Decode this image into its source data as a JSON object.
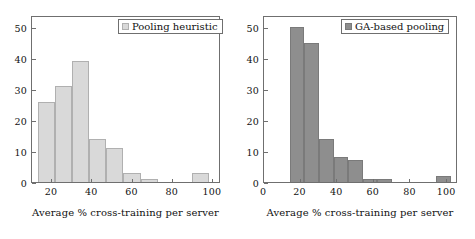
{
  "figure": {
    "width": 475,
    "height": 239,
    "background": "#ffffff"
  },
  "chart_data": [
    {
      "type": "bar",
      "subtype": "histogram",
      "title": "",
      "legend": "Pooling heuristic",
      "legend_position": "top-right",
      "bar_color": "#d9d9d9",
      "bar_edge_color": "#b0b0b0",
      "xlabel": "Average % cross-training per server",
      "ylabel": "",
      "xlim": [
        10,
        104
      ],
      "ylim": [
        0,
        54
      ],
      "xticks": [
        20,
        40,
        60,
        80,
        100
      ],
      "xticklabels": [
        "20",
        "40",
        "60",
        "80",
        "100"
      ],
      "yticks": [
        0,
        10,
        20,
        30,
        40,
        50
      ],
      "yticklabels": [
        "0",
        "10",
        "20",
        "30",
        "40",
        "50"
      ],
      "grid": false,
      "bin_edges": [
        13.0,
        21.5,
        30.0,
        38.5,
        47.0,
        55.5,
        64.0,
        72.5,
        81.0,
        89.5,
        98.0
      ],
      "values": [
        26,
        31,
        39,
        14,
        11,
        3,
        1,
        0,
        0,
        3
      ],
      "bins": [
        {
          "x0": 13.0,
          "x1": 21.5,
          "value": 26
        },
        {
          "x0": 21.5,
          "x1": 30.0,
          "value": 31
        },
        {
          "x0": 30.0,
          "x1": 38.5,
          "value": 39
        },
        {
          "x0": 38.5,
          "x1": 47.0,
          "value": 14
        },
        {
          "x0": 47.0,
          "x1": 55.5,
          "value": 11
        },
        {
          "x0": 55.5,
          "x1": 64.0,
          "value": 3
        },
        {
          "x0": 64.0,
          "x1": 72.5,
          "value": 1
        },
        {
          "x0": 72.5,
          "x1": 81.0,
          "value": 0
        },
        {
          "x0": 81.0,
          "x1": 89.5,
          "value": 0
        },
        {
          "x0": 89.5,
          "x1": 98.0,
          "value": 3
        }
      ]
    },
    {
      "type": "bar",
      "subtype": "histogram",
      "title": "",
      "legend": "GA-based pooling",
      "legend_position": "top-right",
      "bar_color": "#8e8e8e",
      "bar_edge_color": "#7a7a7a",
      "xlabel": "Average % cross-training per server",
      "ylabel": "",
      "xlim": [
        0,
        106
      ],
      "ylim": [
        0,
        54
      ],
      "xticks": [
        0,
        20,
        40,
        60,
        80,
        100
      ],
      "xticklabels": [
        "0",
        "20",
        "40",
        "60",
        "80",
        "100"
      ],
      "yticks": [
        0,
        10,
        20,
        30,
        40,
        50
      ],
      "yticklabels": [
        "0",
        "10",
        "20",
        "30",
        "40",
        "50"
      ],
      "grid": false,
      "bin_edges": [
        14.0,
        22.0,
        30.0,
        38.0,
        46.0,
        54.0,
        62.0,
        70.0,
        78.0,
        86.0,
        94.0,
        102.0
      ],
      "values": [
        50,
        45,
        14,
        8,
        7,
        1,
        1,
        0,
        0,
        2,
        0
      ],
      "bins": [
        {
          "x0": 14.0,
          "x1": 22.0,
          "value": 50
        },
        {
          "x0": 22.0,
          "x1": 30.0,
          "value": 45
        },
        {
          "x0": 30.0,
          "x1": 38.0,
          "value": 14
        },
        {
          "x0": 38.0,
          "x1": 46.0,
          "value": 8
        },
        {
          "x0": 46.0,
          "x1": 54.0,
          "value": 7
        },
        {
          "x0": 54.0,
          "x1": 62.0,
          "value": 1
        },
        {
          "x0": 62.0,
          "x1": 70.0,
          "value": 1
        },
        {
          "x0": 70.0,
          "x1": 78.0,
          "value": 0
        },
        {
          "x0": 78.0,
          "x1": 86.0,
          "value": 0
        },
        {
          "x0": 86.0,
          "x1": 94.0,
          "value": 0
        },
        {
          "x0": 94.0,
          "x1": 102.0,
          "value": 2
        }
      ]
    }
  ]
}
